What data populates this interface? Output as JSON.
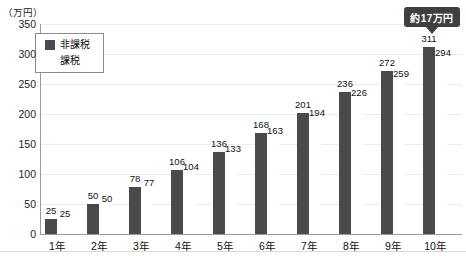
{
  "chart": {
    "unit_label": "（万円）",
    "annotation": {
      "text": "約17万円"
    }
  },
  "chart_data": {
    "type": "bar",
    "title": "",
    "categories": [
      "1年",
      "2年",
      "3年",
      "4年",
      "5年",
      "6年",
      "7年",
      "8年",
      "9年",
      "10年"
    ],
    "series": [
      {
        "name": "非課税",
        "color": "#4a4a4a",
        "values": [
          25,
          50,
          78,
          106,
          136,
          168,
          201,
          236,
          272,
          311
        ]
      },
      {
        "name": "課税",
        "color": "#ffffff",
        "values": [
          25,
          50,
          77,
          104,
          133,
          163,
          194,
          226,
          259,
          294
        ]
      }
    ],
    "xlabel": "",
    "ylabel": "（万円）",
    "ylim": [
      0,
      350
    ],
    "yticks": [
      0,
      50,
      100,
      150,
      200,
      250,
      300,
      350
    ],
    "grid": true,
    "legend_position": "top-left",
    "annotation": {
      "text": "約17万円",
      "target_category": "10年",
      "target_series": "非課税",
      "bg": "#3f3f3f",
      "text_color": "#ffffff"
    }
  }
}
